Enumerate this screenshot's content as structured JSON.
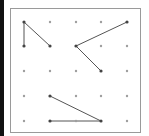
{
  "colors": {
    "left_bar": "#111111",
    "border": "#9a9a9a",
    "line": "#555555",
    "dot": "#9e9e9e",
    "dot_endpoint": "#444444"
  },
  "grid": {
    "cols": 5,
    "rows": 5,
    "x": [
      24,
      50,
      76,
      101,
      127
    ],
    "y": [
      22,
      46,
      71,
      96,
      121
    ]
  },
  "segments": [
    {
      "from": [
        0,
        0
      ],
      "to": [
        0,
        1
      ]
    },
    {
      "from": [
        0,
        0
      ],
      "to": [
        1,
        1
      ]
    },
    {
      "from": [
        2,
        1
      ],
      "to": [
        4,
        0
      ]
    },
    {
      "from": [
        2,
        1
      ],
      "to": [
        3,
        2
      ]
    },
    {
      "from": [
        1,
        3
      ],
      "to": [
        3,
        4
      ]
    },
    {
      "from": [
        1,
        4
      ],
      "to": [
        3,
        4
      ]
    }
  ]
}
